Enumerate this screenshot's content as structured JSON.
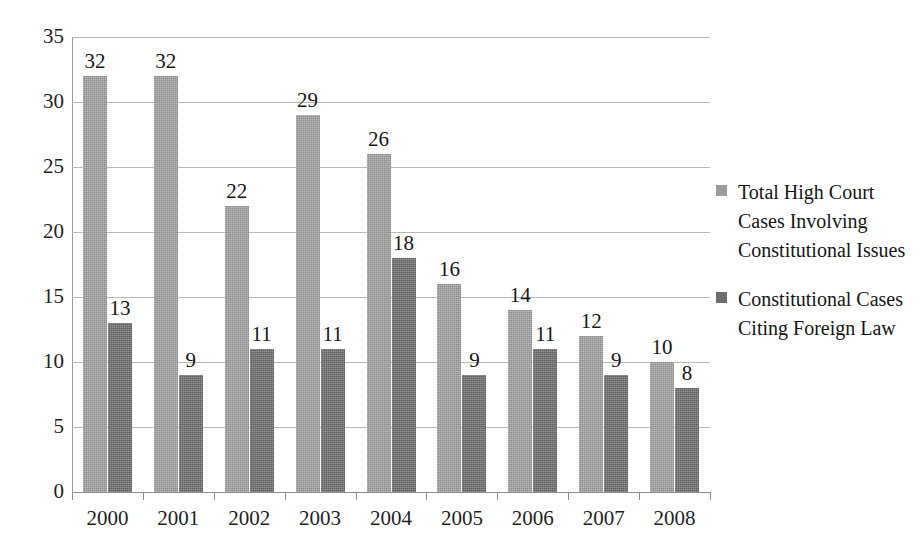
{
  "chart_data": {
    "type": "bar",
    "title": "",
    "subtitle": "",
    "xlabel": "",
    "ylabel": "",
    "categories": [
      "2000",
      "2001",
      "2002",
      "2003",
      "2004",
      "2005",
      "2006",
      "2007",
      "2008"
    ],
    "series": [
      {
        "name": "Total High Court Cases Involving Constitutional Issues",
        "color": "#9d9d9d",
        "values": [
          32,
          32,
          22,
          29,
          26,
          16,
          14,
          12,
          10
        ]
      },
      {
        "name": "Constitutional Cases Citing Foreign Law",
        "color": "#6d6d6d",
        "values": [
          13,
          9,
          11,
          11,
          18,
          9,
          11,
          9,
          8
        ]
      }
    ],
    "ylim": [
      0,
      35
    ],
    "y_ticks": [
      0,
      5,
      10,
      15,
      20,
      25,
      30,
      35
    ],
    "y_tick_labels": [
      "0",
      "5",
      "10",
      "15",
      "20",
      "25",
      "30",
      "35"
    ],
    "grid": true,
    "grid_color": "#b9b9b9",
    "legend_position": "right",
    "data_labels": true,
    "background_color": "#ffffff"
  },
  "legend": {
    "entries": [
      {
        "label": "Total High Court Cases Involving Constitutional Issues",
        "marker": "square-marker",
        "color": "#9d9d9d"
      },
      {
        "label": "Constitutional Cases Citing Foreign Law",
        "marker": "square-marker",
        "color": "#6d6d6d"
      }
    ]
  }
}
